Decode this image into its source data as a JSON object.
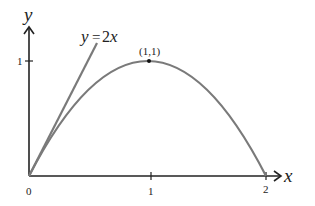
{
  "diagram": {
    "type": "function-plot",
    "axes": {
      "x_label": "x",
      "y_label": "y",
      "x_ticks": [
        "0",
        "1",
        "2"
      ],
      "y_ticks": [
        "1"
      ]
    },
    "curve": {
      "description": "parabola y = 2x - x^2 from (0,0) to (2,0)",
      "vertex_label": "(1,1)",
      "color": "#7a7a7a"
    },
    "tangent_line": {
      "label_y": "y",
      "label_eq": "=",
      "label_2": "2",
      "label_x": "x",
      "color": "#7a7a7a"
    },
    "axis_color": "#222222"
  }
}
